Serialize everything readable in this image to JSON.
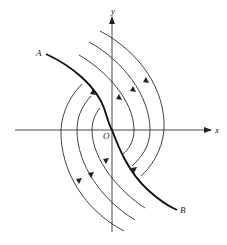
{
  "diagram": {
    "type": "phase-portrait",
    "labels": {
      "x_axis": "x",
      "y_axis": "y",
      "origin": "O",
      "start_point": "A",
      "end_point": "B"
    },
    "colors": {
      "line": "#2a2a2a",
      "separatrix": "#111111",
      "background": "#ffffff"
    },
    "trajectories": {
      "separatrix": "A to B through origin O",
      "right_family_count": 3,
      "left_family_count": 3,
      "right_family_direction": "downward (top-left to bottom)",
      "left_family_direction": "upward (bottom to top)"
    }
  }
}
